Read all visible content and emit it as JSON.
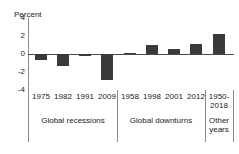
{
  "chart_data": {
    "type": "bar",
    "title": "",
    "subtitle": "",
    "xlabel": "",
    "ylabel": "Percent",
    "ylim": [
      -4,
      4
    ],
    "yticks": [
      4,
      2,
      0,
      -2,
      -4
    ],
    "ytick_labels": [
      "4",
      "2",
      "0",
      "-2",
      "-4"
    ],
    "grid": false,
    "legend": "none",
    "categories": [
      "1975",
      "1982",
      "1991",
      "2009",
      "1958",
      "1998",
      "2001",
      "2012",
      "1950-2018"
    ],
    "values": [
      -0.7,
      -1.3,
      -0.2,
      -2.9,
      0.15,
      1.0,
      0.55,
      1.15,
      2.2
    ],
    "groups": [
      {
        "label": "Global recessions",
        "categories": [
          "1975",
          "1982",
          "1991",
          "2009"
        ],
        "values": [
          -0.7,
          -1.3,
          -0.2,
          -2.9
        ]
      },
      {
        "label": "Global downturns",
        "categories": [
          "1958",
          "1998",
          "2001",
          "2012"
        ],
        "values": [
          0.15,
          1.0,
          0.55,
          1.15
        ]
      },
      {
        "label": "Other years",
        "categories": [
          "1950-2018"
        ],
        "values": [
          2.2
        ]
      }
    ],
    "bar_color": "#3a3a3a"
  },
  "axis": {
    "unit_label": "Percent",
    "ytick_0": "4",
    "ytick_1": "2",
    "ytick_2": "0",
    "ytick_3": "-2",
    "ytick_4": "-4"
  },
  "xticks": {
    "t0": "1975",
    "t1": "1982",
    "t2": "1991",
    "t3": "2009",
    "t4": "1958",
    "t5": "1998",
    "t6": "2001",
    "t7": "2012",
    "t8": "1950-2018"
  },
  "groups": {
    "g0": "Global recessions",
    "g1": "Global downturns",
    "g2": "Other years"
  }
}
